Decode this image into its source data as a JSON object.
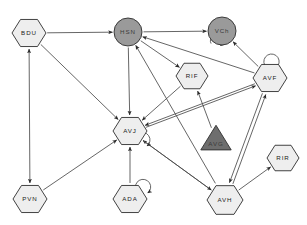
{
  "diagram": {
    "background_color": "#ffffff",
    "edge_color": "#4a4a4a",
    "node_stroke_color": "#2e2e2e",
    "fill_light": "#eeeeee",
    "fill_dark": "#9a9a9a",
    "nodes": [
      {
        "id": "BDU",
        "label": "BDU",
        "shape": "hexagon",
        "fill": "#eeeeee",
        "x": 29,
        "y": 33,
        "r": 17,
        "self_loop": false
      },
      {
        "id": "HSN",
        "label": "HSN",
        "shape": "circle",
        "fill": "#9a9a9a",
        "x": 128,
        "y": 32,
        "r": 14,
        "self_loop": false
      },
      {
        "id": "VCh",
        "label": "VCh",
        "shape": "circle",
        "fill": "#9a9a9a",
        "x": 222,
        "y": 31,
        "r": 14,
        "self_loop": true
      },
      {
        "id": "RIF",
        "label": "RIF",
        "shape": "hexagon",
        "fill": "#eeeeee",
        "x": 192,
        "y": 76,
        "r": 16,
        "self_loop": false
      },
      {
        "id": "AVF",
        "label": "AVF",
        "shape": "hexagon",
        "fill": "#eeeeee",
        "x": 270,
        "y": 78,
        "r": 17,
        "self_loop": true
      },
      {
        "id": "AVJ",
        "label": "AVJ",
        "shape": "hexagon",
        "fill": "#eeeeee",
        "x": 130,
        "y": 131,
        "r": 17,
        "self_loop": true
      },
      {
        "id": "AVG",
        "label": "AVG",
        "shape": "triangle",
        "fill": "#6e6e6e",
        "x": 216,
        "y": 140,
        "r": 16,
        "self_loop": false
      },
      {
        "id": "RIR",
        "label": "RIR",
        "shape": "hexagon",
        "fill": "#eeeeee",
        "x": 283,
        "y": 158,
        "r": 16,
        "self_loop": false
      },
      {
        "id": "PVN",
        "label": "PVN",
        "shape": "hexagon",
        "fill": "#eeeeee",
        "x": 30,
        "y": 199,
        "r": 17,
        "self_loop": false
      },
      {
        "id": "ADA",
        "label": "ADA",
        "shape": "hexagon",
        "fill": "#eeeeee",
        "x": 130,
        "y": 199,
        "r": 17,
        "self_loop": true
      },
      {
        "id": "AVH",
        "label": "AVH",
        "shape": "hexagon",
        "fill": "#eeeeee",
        "x": 225,
        "y": 200,
        "r": 18,
        "self_loop": false
      }
    ],
    "edges": [
      {
        "from": "BDU",
        "to": "HSN",
        "arrow": "end"
      },
      {
        "from": "HSN",
        "to": "VCh",
        "arrow": "end"
      },
      {
        "from": "BDU",
        "to": "AVJ",
        "arrow": "end"
      },
      {
        "from": "BDU",
        "to": "PVN",
        "arrow": "both"
      },
      {
        "from": "HSN",
        "to": "AVJ",
        "arrow": "end"
      },
      {
        "from": "HSN",
        "to": "RIF",
        "arrow": "end"
      },
      {
        "from": "AVF",
        "to": "HSN",
        "arrow": "end"
      },
      {
        "from": "AVH",
        "to": "HSN",
        "arrow": "end"
      },
      {
        "from": "AVF",
        "to": "VCh",
        "arrow": "end"
      },
      {
        "from": "AVG",
        "to": "RIF",
        "arrow": "end"
      },
      {
        "from": "RIF",
        "to": "AVJ",
        "arrow": "end"
      },
      {
        "from": "AVF",
        "to": "AVJ",
        "arrow": "end"
      },
      {
        "from": "AVJ",
        "to": "AVF",
        "arrow": "end"
      },
      {
        "from": "PVN",
        "to": "AVJ",
        "arrow": "end"
      },
      {
        "from": "ADA",
        "to": "AVJ",
        "arrow": "end"
      },
      {
        "from": "AVH",
        "to": "AVJ",
        "arrow": "end"
      },
      {
        "from": "AVJ",
        "to": "AVH",
        "arrow": "end"
      },
      {
        "from": "AVH",
        "to": "AVF",
        "arrow": "both"
      },
      {
        "from": "AVH",
        "to": "RIR",
        "arrow": "end"
      }
    ]
  }
}
